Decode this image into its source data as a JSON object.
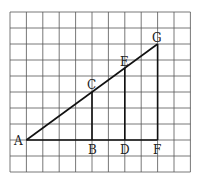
{
  "diagram": {
    "grid": {
      "cols": 11,
      "rows": 10,
      "x0": 10,
      "y0": 12,
      "cell_w": 16.4,
      "cell_h": 16,
      "line_color": "#555555"
    },
    "line_color": "#111111",
    "points": {
      "A": {
        "label": "A",
        "col": 1,
        "row": 8
      },
      "B": {
        "label": "B",
        "col": 5,
        "row": 8
      },
      "C": {
        "label": "C",
        "col": 5,
        "row": 5
      },
      "D": {
        "label": "D",
        "col": 7,
        "row": 8
      },
      "E": {
        "label": "E",
        "col": 7,
        "row": 3.5
      },
      "F": {
        "label": "F",
        "col": 9,
        "row": 8
      },
      "G": {
        "label": "G",
        "col": 9,
        "row": 2
      }
    },
    "segments": [
      [
        "A",
        "G"
      ],
      [
        "A",
        "F"
      ],
      [
        "B",
        "C"
      ],
      [
        "D",
        "E"
      ],
      [
        "F",
        "G"
      ]
    ]
  }
}
